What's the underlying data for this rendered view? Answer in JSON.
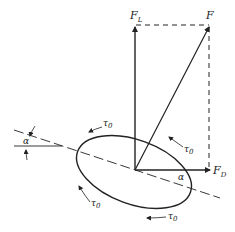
{
  "diagram": {
    "labels": {
      "lift": "F",
      "lift_sub": "L",
      "resultant": "F",
      "drag": "F",
      "drag_sub": "D",
      "angle_left": "α",
      "angle_right": "α",
      "shear": "τ",
      "shear_sub": "0"
    },
    "colors": {
      "stroke": "#222222",
      "background": "#ffffff"
    }
  }
}
